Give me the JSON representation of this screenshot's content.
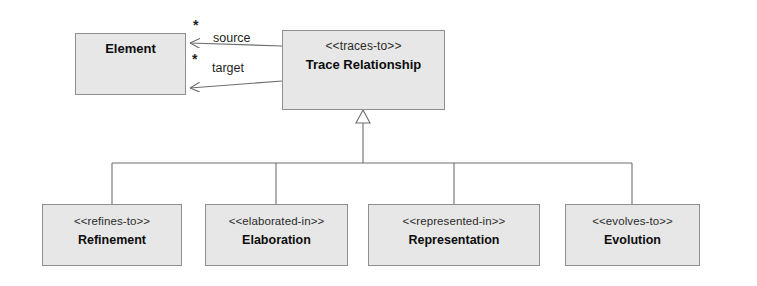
{
  "diagram": {
    "kind": "uml-class-diagram",
    "title": "Trace Relationship",
    "background_color": "#ffffff",
    "box_fill_color": "#e7e7e7",
    "box_border_color": "#8f8f8f",
    "line_color": "#6e6e6e"
  },
  "classes": {
    "element": {
      "name": "Element",
      "stereotype": ""
    },
    "trace_relationship": {
      "stereotype": "<<traces-to>>",
      "name": "Trace Relationship"
    },
    "refinement": {
      "stereotype": "<<refines-to>>",
      "name": "Refinement"
    },
    "elaboration": {
      "stereotype": "<<elaborated-in>>",
      "name": "Elaboration"
    },
    "representation": {
      "stereotype": "<<represented-in>>",
      "name": "Representation"
    },
    "evolution": {
      "stereotype": "<<evolves-to>>",
      "name": "Evolution"
    }
  },
  "associations": [
    {
      "id": "source",
      "role_label": "source",
      "multiplicity": "*",
      "from": "Trace Relationship",
      "to": "Element",
      "arrow": "open"
    },
    {
      "id": "target",
      "role_label": "target",
      "multiplicity": "*",
      "from": "Trace Relationship",
      "to": "Element",
      "arrow": "open"
    }
  ],
  "generalization": {
    "parent": "Trace Relationship",
    "arrow": "hollow-triangle",
    "children": [
      "Refinement",
      "Elaboration",
      "Representation",
      "Evolution"
    ]
  }
}
